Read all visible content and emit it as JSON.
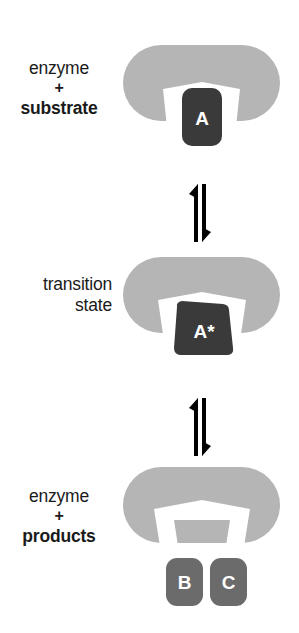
{
  "figure": {
    "type": "enzyme-catalysis-mechanism-diagram",
    "background_color": "#ffffff",
    "colors": {
      "enzyme": "#b5b5b5",
      "substrate": "#3a3a3a",
      "product": "#6b6b6b",
      "cleft": "#ffffff",
      "text": "#1a1a1a",
      "arrow": "#000000"
    }
  },
  "stages": [
    {
      "id": "substrate",
      "label_lines": [
        "enzyme",
        "+",
        "substrate"
      ],
      "label_bold": [
        false,
        false,
        true
      ],
      "molecule_label": "A",
      "molecule_shape": "rounded-square",
      "cleft_shape": "narrow-flared-notch",
      "description": "Enzyme with substrate A bound in the active site"
    },
    {
      "id": "transition",
      "label_lines": [
        "transition",
        "state"
      ],
      "label_bold": [
        false,
        false
      ],
      "molecule_label": "A*",
      "molecule_shape": "trapezoid",
      "cleft_shape": "wide-trapezoid-notch",
      "description": "Enzyme distorting the substrate into the transition state A*"
    },
    {
      "id": "products",
      "label_lines": [
        "enzyme",
        "+",
        "products"
      ],
      "label_bold": [
        false,
        false,
        true
      ],
      "molecule_label": [
        "B",
        "C"
      ],
      "molecule_shape": "two-rounded-squares",
      "cleft_shape": "wide-open-notch",
      "description": "Enzyme releasing the two products B and C"
    }
  ],
  "arrows": [
    {
      "id": "arrow-1",
      "kind": "equilibrium",
      "glyph": "up-down-half-arrows",
      "between": [
        "substrate",
        "transition"
      ]
    },
    {
      "id": "arrow-2",
      "kind": "equilibrium",
      "glyph": "up-down-half-arrows",
      "between": [
        "transition",
        "products"
      ]
    }
  ]
}
